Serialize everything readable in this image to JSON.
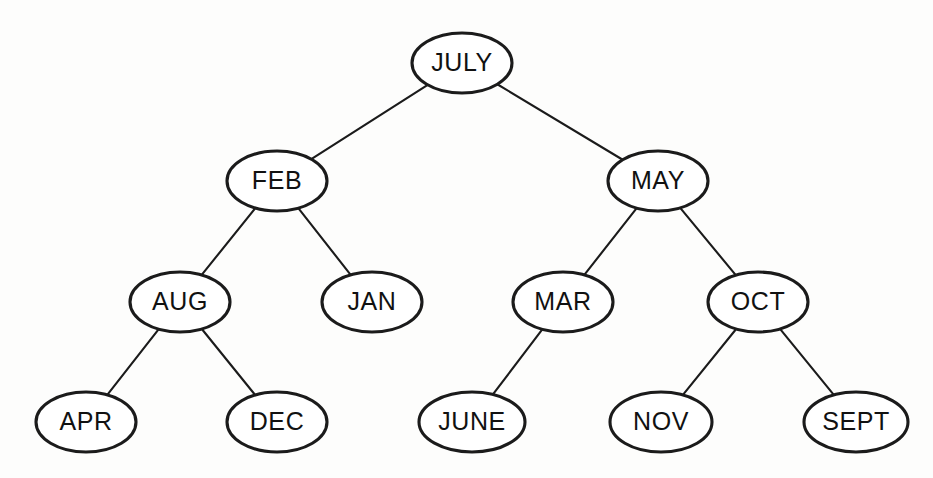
{
  "figure": {
    "type": "binary-search-tree",
    "background_color": "#fdfdfc",
    "node_fill": "#ffffff",
    "node_stroke": "#1b1b1b",
    "edge_stroke": "#1b1b1b",
    "label_color": "#111111"
  },
  "nodes": [
    {
      "id": "july",
      "label": "JULY",
      "cx": 462,
      "cy": 63,
      "rx": 50,
      "ry": 30,
      "level": 0
    },
    {
      "id": "feb",
      "label": "FEB",
      "cx": 277,
      "cy": 181,
      "rx": 50,
      "ry": 30,
      "level": 1
    },
    {
      "id": "may",
      "label": "MAY",
      "cx": 658,
      "cy": 181,
      "rx": 50,
      "ry": 30,
      "level": 1
    },
    {
      "id": "aug",
      "label": "AUG",
      "cx": 180,
      "cy": 302,
      "rx": 50,
      "ry": 30,
      "level": 2
    },
    {
      "id": "jan",
      "label": "JAN",
      "cx": 372,
      "cy": 302,
      "rx": 50,
      "ry": 30,
      "level": 2
    },
    {
      "id": "mar",
      "label": "MAR",
      "cx": 563,
      "cy": 302,
      "rx": 50,
      "ry": 30,
      "level": 2
    },
    {
      "id": "oct",
      "label": "OCT",
      "cx": 758,
      "cy": 302,
      "rx": 50,
      "ry": 30,
      "level": 2
    },
    {
      "id": "apr",
      "label": "APR",
      "cx": 86,
      "cy": 422,
      "rx": 50,
      "ry": 30,
      "level": 3
    },
    {
      "id": "dec",
      "label": "DEC",
      "cx": 277,
      "cy": 422,
      "rx": 50,
      "ry": 30,
      "level": 3
    },
    {
      "id": "june",
      "label": "JUNE",
      "cx": 472,
      "cy": 422,
      "rx": 53,
      "ry": 30,
      "level": 3
    },
    {
      "id": "nov",
      "label": "NOV",
      "cx": 661,
      "cy": 422,
      "rx": 51,
      "ry": 30,
      "level": 3
    },
    {
      "id": "sept",
      "label": "SEPT",
      "cx": 856,
      "cy": 422,
      "rx": 52,
      "ry": 30,
      "level": 3
    }
  ],
  "edges": [
    {
      "id": "july-feb",
      "from": "july",
      "to": "feb",
      "side": "left"
    },
    {
      "id": "july-may",
      "from": "july",
      "to": "may",
      "side": "right"
    },
    {
      "id": "feb-aug",
      "from": "feb",
      "to": "aug",
      "side": "left"
    },
    {
      "id": "feb-jan",
      "from": "feb",
      "to": "jan",
      "side": "right"
    },
    {
      "id": "may-mar",
      "from": "may",
      "to": "mar",
      "side": "left"
    },
    {
      "id": "may-oct",
      "from": "may",
      "to": "oct",
      "side": "right"
    },
    {
      "id": "aug-apr",
      "from": "aug",
      "to": "apr",
      "side": "left"
    },
    {
      "id": "aug-dec",
      "from": "aug",
      "to": "dec",
      "side": "right"
    },
    {
      "id": "mar-june",
      "from": "mar",
      "to": "june",
      "side": "left"
    },
    {
      "id": "oct-nov",
      "from": "oct",
      "to": "nov",
      "side": "left"
    },
    {
      "id": "oct-sept",
      "from": "oct",
      "to": "sept",
      "side": "right"
    }
  ]
}
